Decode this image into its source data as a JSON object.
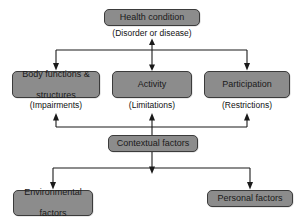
{
  "figure": {
    "background_color": "#ffffff",
    "node_fill_color": "#8c8c8c",
    "node_border_color": "#3b3b3b",
    "connector_color": "#1a1a1a",
    "caption": ""
  },
  "nodes": {
    "health_condition": {
      "label": "Health condition",
      "sublabel": "(Disorder or disease)"
    },
    "body_functions": {
      "label": "Body functions & structures",
      "line1": "Body functions &",
      "line2": "structures",
      "sublabel": "(Impairments)"
    },
    "activity": {
      "label": "Activity",
      "sublabel": "(Limitations)"
    },
    "participation": {
      "label": "Participation",
      "sublabel": "(Restrictions)"
    },
    "contextual_factors": {
      "label": "Contextual factors"
    },
    "environmental_factors": {
      "label": "Environmental factors",
      "line1": "Environmental",
      "line2": "factors"
    },
    "personal_factors": {
      "label": "Personal factors"
    }
  },
  "connectors": [
    {
      "name": "health-to-domains-bus",
      "from": "health_condition",
      "to": [
        "body_functions",
        "activity",
        "participation"
      ],
      "style": "bus-with-arrowheads"
    },
    {
      "name": "health-activity-bidirectional",
      "from": "health_condition",
      "to": "activity",
      "style": "double-headed"
    },
    {
      "name": "contextual-to-domains-bus",
      "from": "contextual_factors",
      "to": [
        "body_functions",
        "activity",
        "participation"
      ],
      "style": "bus-with-arrowheads"
    },
    {
      "name": "contextual-to-factors-bus",
      "from": "contextual_factors",
      "to": [
        "environmental_factors",
        "personal_factors"
      ],
      "style": "bus-with-arrowheads"
    }
  ]
}
